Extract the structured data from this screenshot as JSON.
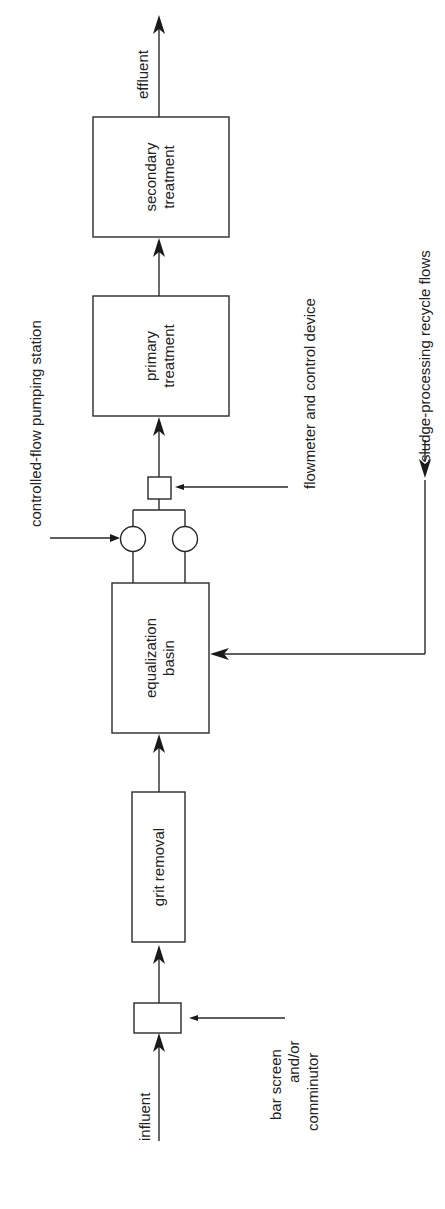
{
  "diagram": {
    "title": "",
    "orientation": "rotated -90deg (flow bottom to top)",
    "process_units": [
      {
        "id": "bar_screen",
        "label": ""
      },
      {
        "id": "grit_removal",
        "label": "grit removal"
      },
      {
        "id": "equalization_basin",
        "label_line1": "equalization",
        "label_line2": "basin"
      },
      {
        "id": "pumps",
        "label": ""
      },
      {
        "id": "flowmeter",
        "label": ""
      },
      {
        "id": "primary_treatment",
        "label_line1": "primary",
        "label_line2": "treatment"
      },
      {
        "id": "secondary_treatment",
        "label_line1": "secondary",
        "label_line2": "treatment"
      }
    ],
    "streams": {
      "influent": "influent",
      "effluent": "effluent",
      "recycle": "sludge-processing recycle flows"
    },
    "annotations": {
      "bar_screen_line1": "bar screen",
      "bar_screen_line2": "and/or",
      "bar_screen_line3": "comminutor",
      "pumping_station": "controlled-flow pumping station",
      "flowmeter": "flowmeter and control device"
    },
    "colors": {
      "line": "#2a2a2a",
      "background": "#ffffff"
    }
  }
}
